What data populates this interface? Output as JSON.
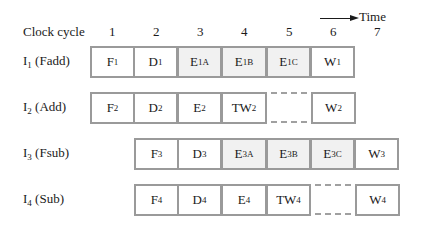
{
  "header": {
    "clock_cycle_label": "Clock cycle",
    "time_label": "Time",
    "time_arrow_icon": "right-arrow-icon",
    "columns": [
      "1",
      "2",
      "3",
      "4",
      "5",
      "6",
      "7"
    ]
  },
  "rows": [
    {
      "label": "I",
      "label_sub": "1",
      "label_suffix": " (Fadd)",
      "cells": [
        {
          "col": 1,
          "text": "F",
          "sub": "1",
          "shaded": false
        },
        {
          "col": 2,
          "text": "D",
          "sub": "1",
          "shaded": false
        },
        {
          "col": 3,
          "text": "E",
          "sub": "1A",
          "shaded": true
        },
        {
          "col": 4,
          "text": "E",
          "sub": "1B",
          "shaded": true
        },
        {
          "col": 5,
          "text": "E",
          "sub": "1C",
          "shaded": true
        },
        {
          "col": 6,
          "text": "W",
          "sub": "1",
          "shaded": false
        }
      ]
    },
    {
      "label": "I",
      "label_sub": "2",
      "label_suffix": " (Add)",
      "cells": [
        {
          "col": 1,
          "text": "F",
          "sub": "2",
          "shaded": false
        },
        {
          "col": 2,
          "text": "D",
          "sub": "2",
          "shaded": false
        },
        {
          "col": 3,
          "text": "E",
          "sub": "2",
          "shaded": false
        },
        {
          "col": 4,
          "text": "TW",
          "sub": "2",
          "shaded": false
        },
        {
          "col": 5,
          "text": "",
          "sub": "",
          "gap": true
        },
        {
          "col": 6,
          "text": "W",
          "sub": "2",
          "shaded": false
        }
      ]
    },
    {
      "label": "I",
      "label_sub": "3",
      "label_suffix": " (Fsub)",
      "cells": [
        {
          "col": 2,
          "text": "F",
          "sub": "3",
          "shaded": false
        },
        {
          "col": 3,
          "text": "D",
          "sub": "3",
          "shaded": false
        },
        {
          "col": 4,
          "text": "E",
          "sub": "3A",
          "shaded": true
        },
        {
          "col": 5,
          "text": "E",
          "sub": "3B",
          "shaded": true
        },
        {
          "col": 6,
          "text": "E",
          "sub": "3C",
          "shaded": true
        },
        {
          "col": 7,
          "text": "W",
          "sub": "3",
          "shaded": false
        }
      ]
    },
    {
      "label": "I",
      "label_sub": "4",
      "label_suffix": " (Sub)",
      "cells": [
        {
          "col": 2,
          "text": "F",
          "sub": "4",
          "shaded": false
        },
        {
          "col": 3,
          "text": "D",
          "sub": "4",
          "shaded": false
        },
        {
          "col": 4,
          "text": "E",
          "sub": "4",
          "shaded": false
        },
        {
          "col": 5,
          "text": "TW",
          "sub": "4",
          "shaded": false
        },
        {
          "col": 6,
          "text": "",
          "sub": "",
          "gap": true
        },
        {
          "col": 7,
          "text": "W",
          "sub": "4",
          "shaded": false
        }
      ]
    }
  ],
  "colors": {
    "border": "#9a9a9a",
    "shaded_fill": "#f1f1f1",
    "text": "#1a1a1a"
  }
}
